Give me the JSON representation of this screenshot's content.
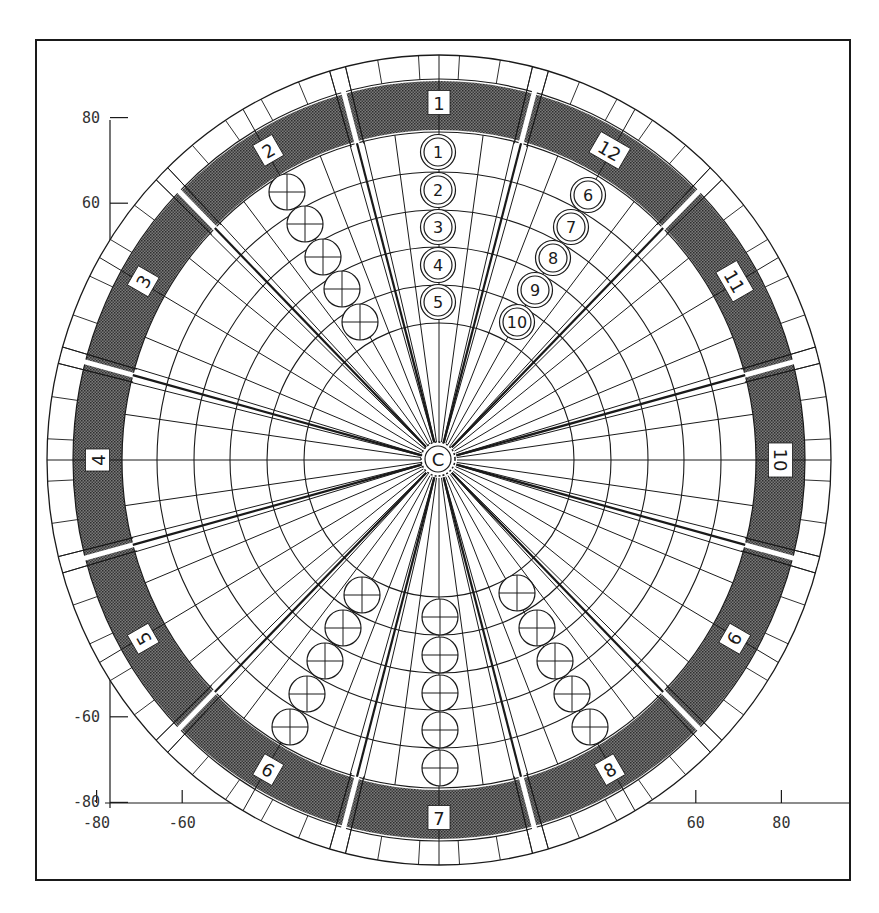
{
  "figure": {
    "type": "polar sector layout diagram",
    "center_label": "C",
    "frame": {
      "x": 36,
      "y": 40,
      "w": 814,
      "h": 840
    },
    "colors": {
      "ink": "#1a1a1a",
      "band_fill": "#5a5a5a",
      "background": "#ffffff"
    }
  },
  "axes": {
    "x_ticks": [
      {
        "label": "-80",
        "value": -80
      },
      {
        "label": "-60",
        "value": -60
      },
      {
        "label": "60",
        "value": 60
      },
      {
        "label": "80",
        "value": 80
      }
    ],
    "y_ticks": [
      {
        "label": "80",
        "value": 80
      },
      {
        "label": "60",
        "value": 60
      },
      {
        "label": "-4",
        "value": -40
      },
      {
        "label": "-60",
        "value": -60
      },
      {
        "label": "-80",
        "value": -80
      }
    ]
  },
  "sectors": [
    {
      "label": "1",
      "angle": 90
    },
    {
      "label": "2",
      "angle": 120
    },
    {
      "label": "3",
      "angle": 150
    },
    {
      "label": "4",
      "angle": 180
    },
    {
      "label": "5",
      "angle": 210
    },
    {
      "label": "6",
      "angle": 240
    },
    {
      "label": "7",
      "angle": 270
    },
    {
      "label": "8",
      "angle": 300
    },
    {
      "label": "9",
      "angle": 330
    },
    {
      "label": "10",
      "angle": 0
    },
    {
      "label": "11",
      "angle": 30
    },
    {
      "label": "12",
      "angle": 60
    }
  ],
  "numbered_positions": [
    {
      "label": "1",
      "x": 438,
      "y": 152
    },
    {
      "label": "2",
      "x": 438,
      "y": 190
    },
    {
      "label": "3",
      "x": 438,
      "y": 227
    },
    {
      "label": "4",
      "x": 438,
      "y": 265
    },
    {
      "label": "5",
      "x": 438,
      "y": 302
    },
    {
      "label": "6",
      "x": 588,
      "y": 195
    },
    {
      "label": "7",
      "x": 571,
      "y": 227
    },
    {
      "label": "8",
      "x": 553,
      "y": 258
    },
    {
      "label": "9",
      "x": 535,
      "y": 290
    },
    {
      "label": "10",
      "x": 517,
      "y": 322
    }
  ],
  "crossed_positions": [
    {
      "sector": "2",
      "x": 287,
      "y": 192
    },
    {
      "sector": "2",
      "x": 305,
      "y": 224
    },
    {
      "sector": "2",
      "x": 323,
      "y": 257
    },
    {
      "sector": "2",
      "x": 342,
      "y": 289
    },
    {
      "sector": "2",
      "x": 360,
      "y": 322
    },
    {
      "sector": "6",
      "x": 362,
      "y": 595
    },
    {
      "sector": "6",
      "x": 343,
      "y": 628
    },
    {
      "sector": "6",
      "x": 325,
      "y": 661
    },
    {
      "sector": "6",
      "x": 307,
      "y": 694
    },
    {
      "sector": "6",
      "x": 290,
      "y": 727
    },
    {
      "sector": "7",
      "x": 440,
      "y": 617
    },
    {
      "sector": "7",
      "x": 440,
      "y": 655
    },
    {
      "sector": "7",
      "x": 440,
      "y": 693
    },
    {
      "sector": "7",
      "x": 440,
      "y": 730
    },
    {
      "sector": "7",
      "x": 440,
      "y": 768
    },
    {
      "sector": "8",
      "x": 517,
      "y": 593
    },
    {
      "sector": "8",
      "x": 537,
      "y": 628
    },
    {
      "sector": "8",
      "x": 555,
      "y": 661
    },
    {
      "sector": "8",
      "x": 572,
      "y": 694
    },
    {
      "sector": "8",
      "x": 590,
      "y": 727
    }
  ]
}
